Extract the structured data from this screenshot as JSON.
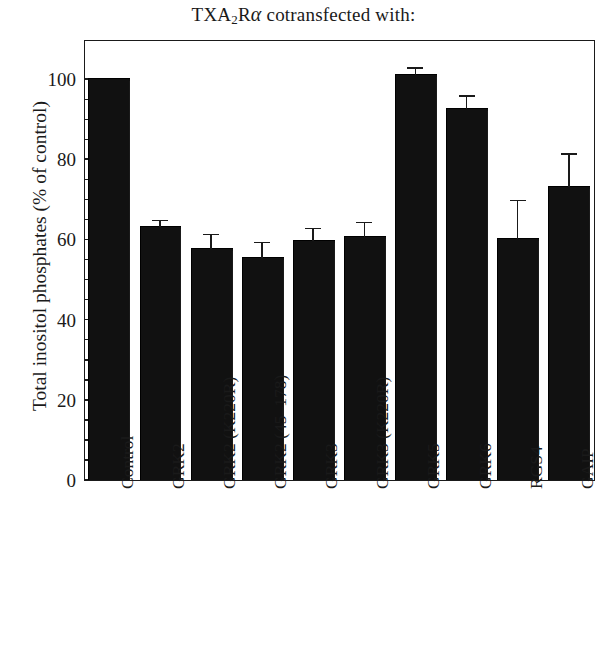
{
  "chart_data": {
    "type": "bar",
    "title": "TXA2Rα cotransfected with:",
    "title_parts": {
      "lead": "TXA",
      "sub": "2",
      "mid": "R",
      "greek": "α",
      "tail": " cotransfected with:"
    },
    "xlabel": "",
    "ylabel": "Total inositol phosphates (% of control)",
    "ylim": [
      0,
      110
    ],
    "yticks": [
      0,
      20,
      40,
      60,
      80,
      100
    ],
    "ytick_labels": [
      "0",
      "20",
      "40",
      "60",
      "80",
      "100"
    ],
    "minor_tick_interval": 5,
    "grid": false,
    "legend": "none",
    "bar_color": "#111111",
    "categories": [
      "Control",
      "GRK2",
      "GRK2 (K220R)",
      "GRK2 (45–178)",
      "GRK3",
      "GRK3 (K220R)",
      "GRK5",
      "GRK6",
      "RGS4",
      "GAIP"
    ],
    "values": [
      100,
      63,
      57.5,
      55.5,
      59.5,
      60.5,
      101,
      92.5,
      60,
      73
    ],
    "errors": [
      0,
      1.5,
      3.5,
      3.5,
      3,
      3.5,
      1.5,
      3,
      9.5,
      8
    ],
    "series": [
      {
        "name": "Total inositol phosphates (% of control)",
        "values": [
          100,
          63,
          57.5,
          55.5,
          59.5,
          60.5,
          101,
          92.5,
          60,
          73
        ],
        "errors": [
          0,
          1.5,
          3.5,
          3.5,
          3,
          3.5,
          1.5,
          3,
          9.5,
          8
        ]
      }
    ]
  }
}
